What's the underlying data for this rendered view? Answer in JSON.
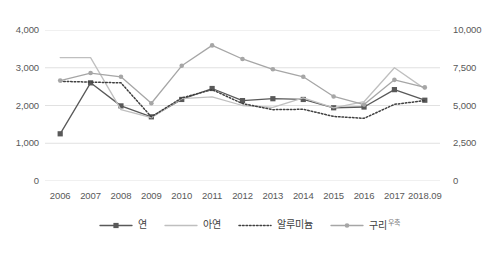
{
  "chart_data": {
    "type": "line",
    "title": "",
    "xlabel": "",
    "ylabel": "",
    "categories": [
      "2006",
      "2007",
      "2008",
      "2009",
      "2010",
      "2011",
      "2012",
      "2013",
      "2014",
      "2015",
      "2016",
      "2017",
      "2018.09"
    ],
    "left_axis": {
      "ticks": [
        "0",
        "1,000",
        "2,000",
        "3,000",
        "4,000"
      ],
      "values": [
        0,
        1000,
        2000,
        3000,
        4000
      ],
      "ylim": [
        0,
        4000
      ]
    },
    "right_axis": {
      "ticks": [
        "0",
        "2,500",
        "5,000",
        "7,500",
        "10,000"
      ],
      "values": [
        0,
        2500,
        5000,
        7500,
        10000
      ],
      "ylim": [
        0,
        10000
      ],
      "note": "우축"
    },
    "grid": true,
    "legend_position": "bottom",
    "series": [
      {
        "name": "연",
        "axis": "left",
        "color": "#595959",
        "style": "solid",
        "marker": "square",
        "values": [
          1250,
          2600,
          1990,
          1700,
          2160,
          2450,
          2130,
          2180,
          2160,
          1940,
          1960,
          2420,
          2140
        ]
      },
      {
        "name": "아연",
        "axis": "left",
        "color": "#bfbfbf",
        "style": "solid",
        "marker": "none",
        "values": [
          3270,
          3270,
          1890,
          1680,
          2180,
          2230,
          2000,
          1950,
          2200,
          1940,
          2100,
          3000,
          2440
        ]
      },
      {
        "name": "알루미늄",
        "axis": "left",
        "color": "#404040",
        "style": "dotted",
        "marker": "none",
        "values": [
          2640,
          2620,
          2600,
          1700,
          2200,
          2420,
          2050,
          1890,
          1900,
          1710,
          1660,
          2030,
          2130
        ]
      },
      {
        "name": "구리",
        "axis": "right",
        "color": "#a6a6a6",
        "style": "solid",
        "marker": "circle",
        "values": [
          6650,
          7150,
          6900,
          5150,
          7630,
          8980,
          8080,
          7400,
          6900,
          5600,
          5060,
          6700,
          6200
        ]
      }
    ]
  },
  "legend": {
    "items": [
      {
        "label": "연",
        "sub": ""
      },
      {
        "label": "아연",
        "sub": ""
      },
      {
        "label": "알루미늄",
        "sub": ""
      },
      {
        "label": "구리",
        "sub": "우축"
      }
    ]
  }
}
